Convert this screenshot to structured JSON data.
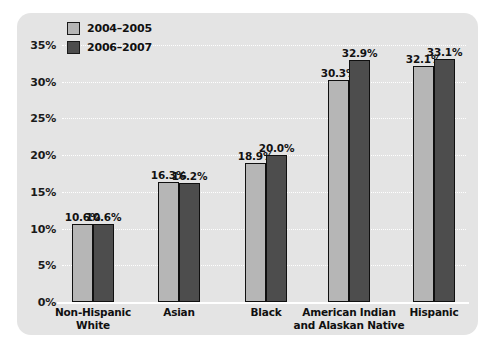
{
  "chart_data": {
    "type": "bar",
    "title": "",
    "xlabel": "",
    "ylabel": "",
    "ylim": [
      0,
      35
    ],
    "ytick_step": 5,
    "grid": true,
    "legend_position": "top-left",
    "categories": [
      "Non-Hispanic\nWhite",
      "Asian",
      "Black",
      "American Indian\nand Alaskan Native",
      "Hispanic"
    ],
    "category_lines": [
      [
        "Non-Hispanic",
        "White"
      ],
      [
        "Asian"
      ],
      [
        "Black"
      ],
      [
        "American Indian",
        "and Alaskan Native"
      ],
      [
        "Hispanic"
      ]
    ],
    "ytick_labels": [
      "35%",
      "30%",
      "25%",
      "20%",
      "15%",
      "10%",
      "5%",
      "0%"
    ],
    "ytick_values": [
      35,
      30,
      25,
      20,
      15,
      10,
      5,
      0
    ],
    "series": [
      {
        "name": "2004–2005",
        "color": "#b6b6b6",
        "values": [
          10.6,
          16.3,
          18.9,
          30.3,
          32.1
        ],
        "data_labels": [
          "10.6%",
          "16.3%",
          "18.9%",
          "30.3%",
          "32.1%"
        ]
      },
      {
        "name": "2006–2007",
        "color": "#4d4d4d",
        "values": [
          10.6,
          16.2,
          20.0,
          32.9,
          33.1
        ],
        "data_labels": [
          "10.6%",
          "16.2%",
          "20.0%",
          "32.9%",
          "33.1%"
        ]
      }
    ]
  },
  "legend": {
    "items": [
      {
        "label": "2004–2005",
        "swatch": "light-gray-swatch"
      },
      {
        "label": "2006–2007",
        "swatch": "dark-gray-swatch"
      }
    ]
  },
  "colors": {
    "panel_background": "#e4e4e4",
    "page_background": "#ffffff",
    "gridline": "#ffffff",
    "series_1": "#b6b6b6",
    "series_2": "#4d4d4d",
    "bar_outline": "#101010",
    "text": "#101010"
  }
}
